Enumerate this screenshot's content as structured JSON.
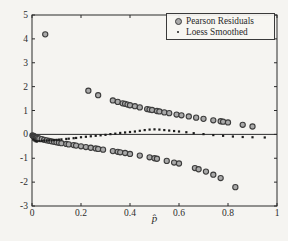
{
  "figure": {
    "background": "#f5f4f1",
    "axis_color": "#2b2b2b"
  },
  "legend": {
    "items": [
      {
        "label": "Pearson Residuals",
        "marker": "circle"
      },
      {
        "label": "Loess Smoothed",
        "marker": "dot"
      }
    ]
  },
  "chart_data": {
    "type": "scatter",
    "title": "",
    "xlabel": "p̂",
    "ylabel": "",
    "xlim": [
      0,
      1
    ],
    "ylim": [
      -3,
      5
    ],
    "xticks": [
      0,
      0.2,
      0.4,
      0.6,
      0.8,
      1
    ],
    "xtick_labels": [
      "0",
      "0.2",
      "0.4",
      "0.6",
      "0.8",
      "1"
    ],
    "yticks": [
      -3,
      -2,
      -1,
      0,
      1,
      2,
      3,
      4,
      5
    ],
    "ytick_labels": [
      "-3",
      "-2",
      "-1",
      "0",
      "1",
      "2",
      "3",
      "4",
      "5"
    ],
    "grid": false,
    "legend_position": "top-right",
    "reference_line_y": 0,
    "series": [
      {
        "name": "Pearson Residuals",
        "marker": "circle",
        "color": "#a9a9a9",
        "edge_color": "#3c3c3c",
        "points": [
          [
            0.054,
            4.19
          ],
          [
            0.23,
            1.83
          ],
          [
            0.27,
            1.64
          ],
          [
            0.33,
            1.42
          ],
          [
            0.35,
            1.36
          ],
          [
            0.37,
            1.3
          ],
          [
            0.38,
            1.28
          ],
          [
            0.39,
            1.25
          ],
          [
            0.4,
            1.22
          ],
          [
            0.42,
            1.18
          ],
          [
            0.44,
            1.13
          ],
          [
            0.47,
            1.06
          ],
          [
            0.48,
            1.04
          ],
          [
            0.49,
            1.02
          ],
          [
            0.51,
            0.98
          ],
          [
            0.52,
            0.96
          ],
          [
            0.54,
            0.92
          ],
          [
            0.56,
            0.89
          ],
          [
            0.59,
            0.83
          ],
          [
            0.61,
            0.8
          ],
          [
            0.64,
            0.75
          ],
          [
            0.67,
            0.7
          ],
          [
            0.7,
            0.65
          ],
          [
            0.74,
            0.59
          ],
          [
            0.77,
            0.55
          ],
          [
            0.78,
            0.53
          ],
          [
            0.8,
            0.5
          ],
          [
            0.86,
            0.4
          ],
          [
            0.9,
            0.33
          ],
          [
            0.002,
            -0.04
          ],
          [
            0.004,
            -0.06
          ],
          [
            0.006,
            -0.08
          ],
          [
            0.008,
            -0.09
          ],
          [
            0.01,
            -0.1
          ],
          [
            0.013,
            -0.11
          ],
          [
            0.016,
            -0.13
          ],
          [
            0.02,
            -0.14
          ],
          [
            0.025,
            -0.16
          ],
          [
            0.03,
            -0.18
          ],
          [
            0.04,
            -0.2
          ],
          [
            0.05,
            -0.23
          ],
          [
            0.06,
            -0.25
          ],
          [
            0.07,
            -0.27
          ],
          [
            0.08,
            -0.29
          ],
          [
            0.09,
            -0.31
          ],
          [
            0.1,
            -0.33
          ],
          [
            0.11,
            -0.35
          ],
          [
            0.12,
            -0.37
          ],
          [
            0.14,
            -0.4
          ],
          [
            0.15,
            -0.42
          ],
          [
            0.17,
            -0.45
          ],
          [
            0.18,
            -0.47
          ],
          [
            0.2,
            -0.5
          ],
          [
            0.22,
            -0.53
          ],
          [
            0.24,
            -0.56
          ],
          [
            0.26,
            -0.59
          ],
          [
            0.27,
            -0.61
          ],
          [
            0.29,
            -0.64
          ],
          [
            0.33,
            -0.7
          ],
          [
            0.35,
            -0.73
          ],
          [
            0.36,
            -0.75
          ],
          [
            0.38,
            -0.78
          ],
          [
            0.4,
            -0.82
          ],
          [
            0.44,
            -0.89
          ],
          [
            0.48,
            -0.96
          ],
          [
            0.5,
            -1.0
          ],
          [
            0.51,
            -1.02
          ],
          [
            0.55,
            -1.11
          ],
          [
            0.58,
            -1.18
          ],
          [
            0.6,
            -1.22
          ],
          [
            0.665,
            -1.41
          ],
          [
            0.68,
            -1.46
          ],
          [
            0.71,
            -1.56
          ],
          [
            0.74,
            -1.69
          ],
          [
            0.77,
            -1.83
          ],
          [
            0.83,
            -2.21
          ]
        ]
      },
      {
        "name": "Loess Smoothed",
        "marker": "dot",
        "color": "#1c1c1c",
        "points": [
          [
            0.005,
            -0.22
          ],
          [
            0.01,
            -0.26
          ],
          [
            0.015,
            -0.29
          ],
          [
            0.02,
            -0.3
          ],
          [
            0.03,
            -0.28
          ],
          [
            0.04,
            -0.27
          ],
          [
            0.05,
            -0.26
          ],
          [
            0.06,
            -0.26
          ],
          [
            0.07,
            -0.25
          ],
          [
            0.08,
            -0.25
          ],
          [
            0.09,
            -0.24
          ],
          [
            0.1,
            -0.23
          ],
          [
            0.11,
            -0.22
          ],
          [
            0.12,
            -0.21
          ],
          [
            0.14,
            -0.19
          ],
          [
            0.15,
            -0.18
          ],
          [
            0.17,
            -0.16
          ],
          [
            0.18,
            -0.15
          ],
          [
            0.2,
            -0.12
          ],
          [
            0.22,
            -0.1
          ],
          [
            0.24,
            -0.08
          ],
          [
            0.26,
            -0.06
          ],
          [
            0.28,
            -0.04
          ],
          [
            0.3,
            -0.02
          ],
          [
            0.32,
            0.01
          ],
          [
            0.34,
            0.03
          ],
          [
            0.36,
            0.06
          ],
          [
            0.38,
            0.08
          ],
          [
            0.4,
            0.1
          ],
          [
            0.42,
            0.12
          ],
          [
            0.44,
            0.15
          ],
          [
            0.46,
            0.18
          ],
          [
            0.48,
            0.2
          ],
          [
            0.5,
            0.21
          ],
          [
            0.52,
            0.2
          ],
          [
            0.54,
            0.18
          ],
          [
            0.56,
            0.16
          ],
          [
            0.58,
            0.14
          ],
          [
            0.6,
            0.12
          ],
          [
            0.63,
            0.09
          ],
          [
            0.66,
            0.05
          ],
          [
            0.7,
            0.01
          ],
          [
            0.74,
            -0.03
          ],
          [
            0.78,
            -0.06
          ],
          [
            0.82,
            -0.09
          ],
          [
            0.86,
            -0.11
          ],
          [
            0.9,
            -0.12
          ],
          [
            0.95,
            -0.13
          ]
        ]
      }
    ]
  }
}
